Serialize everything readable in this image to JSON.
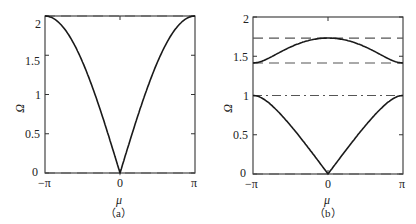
{
  "chart_data": [
    {
      "type": "line",
      "panel_label": "(a)",
      "title": "",
      "xlabel": "μ",
      "ylabel": "Ω",
      "xlim": [
        -3.14159,
        3.14159
      ],
      "ylim": [
        0,
        2
      ],
      "xticks": [
        "−π",
        "0",
        "π"
      ],
      "yticks": [
        "0",
        "0.5",
        "1",
        "1.5",
        "2"
      ],
      "grid": false,
      "series": [
        {
          "name": "acoustic branch",
          "style": "solid",
          "formula": "2*|sin(mu/2)|",
          "x": [
            -3.1416,
            -2.3562,
            -1.5708,
            -0.7854,
            0,
            0.7854,
            1.5708,
            2.3562,
            3.1416
          ],
          "y": [
            2.0,
            1.848,
            1.414,
            0.765,
            0.0,
            0.765,
            1.414,
            1.848,
            2.0
          ]
        }
      ],
      "reference_lines": [
        {
          "y": 2.0,
          "style": "dashed"
        },
        {
          "y": 0.0,
          "style": "dashed"
        }
      ]
    },
    {
      "type": "line",
      "panel_label": "(b)",
      "title": "",
      "xlabel": "μ",
      "ylabel": "Ω",
      "xlim": [
        -3.14159,
        3.14159
      ],
      "ylim": [
        0,
        2
      ],
      "xticks": [
        "−π",
        "0",
        "π"
      ],
      "yticks": [
        "0",
        "0.5",
        "1",
        "1.5",
        "2"
      ],
      "grid": false,
      "series": [
        {
          "name": "acoustic branch",
          "style": "solid",
          "x": [
            -3.1416,
            -2.3562,
            -1.5708,
            -0.7854,
            0,
            0.7854,
            1.5708,
            2.3562,
            3.1416
          ],
          "y": [
            1.0,
            0.924,
            0.707,
            0.383,
            0.0,
            0.383,
            0.707,
            0.924,
            1.0
          ]
        },
        {
          "name": "optical branch",
          "style": "solid",
          "x": [
            -3.1416,
            -2.3562,
            -1.5708,
            -0.7854,
            0,
            0.7854,
            1.5708,
            2.3562,
            3.1416
          ],
          "y": [
            1.414,
            1.47,
            1.58,
            1.69,
            1.732,
            1.69,
            1.58,
            1.47,
            1.414
          ]
        }
      ],
      "reference_lines": [
        {
          "y": 1.732,
          "style": "dashed"
        },
        {
          "y": 1.414,
          "style": "dashed"
        },
        {
          "y": 1.0,
          "style": "dash-dot"
        },
        {
          "y": 0.0,
          "style": "dashed"
        }
      ]
    }
  ],
  "panels": {
    "a": {
      "caption": "（a）",
      "xlabel": "μ",
      "ylabel": "Ω",
      "yticks": [
        "0",
        "0.5",
        "1",
        "1.5",
        "2"
      ],
      "xticks": [
        "−π",
        "0",
        "π"
      ]
    },
    "b": {
      "caption": "（b）",
      "xlabel": "μ",
      "ylabel": "Ω",
      "yticks": [
        "0",
        "0.5",
        "1",
        "1.5",
        "2"
      ],
      "xticks": [
        "−π",
        "0",
        "π"
      ]
    }
  },
  "colors": {
    "line": "#1a1a1a",
    "dashed": "#555555",
    "axis": "#333333"
  }
}
